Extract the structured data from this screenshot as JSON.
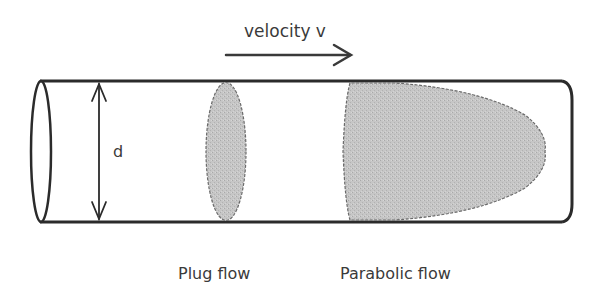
{
  "diagram": {
    "velocity_label": "velocity v",
    "diameter_label": "d",
    "plug_flow_label": "Plug flow",
    "parabolic_flow_label": "Parabolic flow",
    "colors": {
      "stroke": "#2b2b2b",
      "fill": "#c4c4c4",
      "text": "#3a3a3a",
      "background": "#ffffff"
    }
  }
}
